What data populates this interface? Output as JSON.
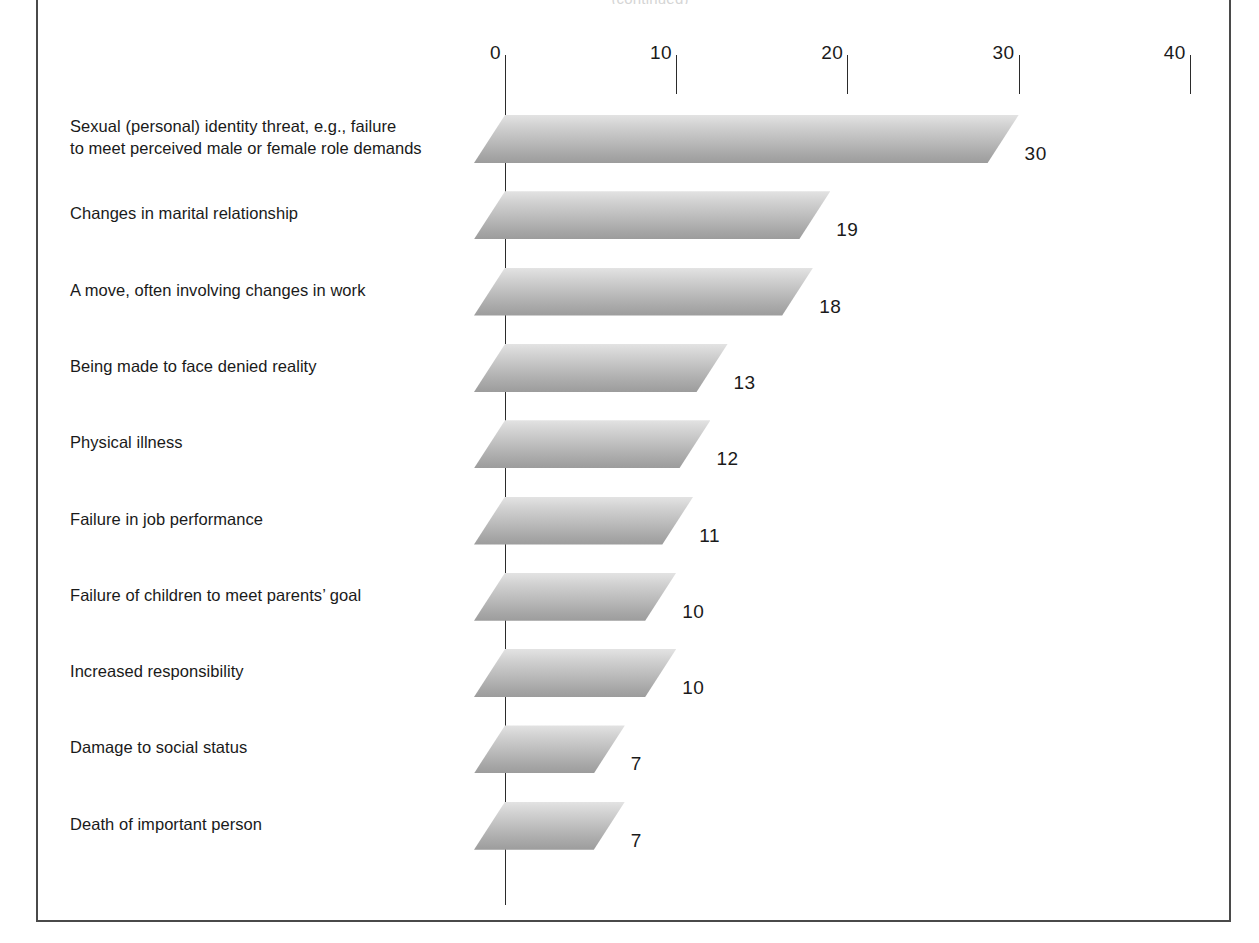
{
  "figure": {
    "top_caption": "(continued)",
    "frame": {
      "border_color": "#4a4a4a"
    }
  },
  "chart_data": {
    "type": "bar",
    "orientation": "horizontal",
    "title": "",
    "subtitle": "",
    "xlabel": "",
    "ylabel": "",
    "xlim": [
      0,
      40
    ],
    "xticks": [
      0,
      10,
      20,
      30,
      40
    ],
    "xtick_labels": [
      "0",
      "10",
      "20",
      "30",
      "40"
    ],
    "grid": false,
    "legend": null,
    "bar_style": "skewed-parallelogram-gradient",
    "bar_color_top": "#e3e3e3",
    "bar_color_bottom": "#9c9c9c",
    "axis_color": "#2b2b2b",
    "categories": [
      "Sexual (personal) identity threat, e.g., failure to meet perceived male or female role demands",
      "Changes in marital relationship",
      "A move, often involving changes in work",
      "Being made to face denied reality",
      "Physical illness",
      "Failure in job performance",
      "Failure of children to meet parents’ goal",
      "Increased responsibility",
      "Damage to social status",
      "Death of important person"
    ],
    "category_lines": [
      [
        "Sexual (personal) identity threat, e.g., failure",
        "to meet perceived male or female role demands"
      ],
      [
        "Changes in marital relationship"
      ],
      [
        "A move, often involving changes in work"
      ],
      [
        "Being made to face denied reality"
      ],
      [
        "Physical illness"
      ],
      [
        "Failure in job performance"
      ],
      [
        "Failure of children to meet parents’ goal"
      ],
      [
        "Increased responsibility"
      ],
      [
        "Damage to social status"
      ],
      [
        "Death of important person"
      ]
    ],
    "values": [
      30,
      19,
      18,
      13,
      12,
      11,
      10,
      10,
      7,
      7
    ],
    "value_labels": [
      "30",
      "19",
      "18",
      "13",
      "12",
      "11",
      "10",
      "10",
      "7",
      "7"
    ]
  }
}
